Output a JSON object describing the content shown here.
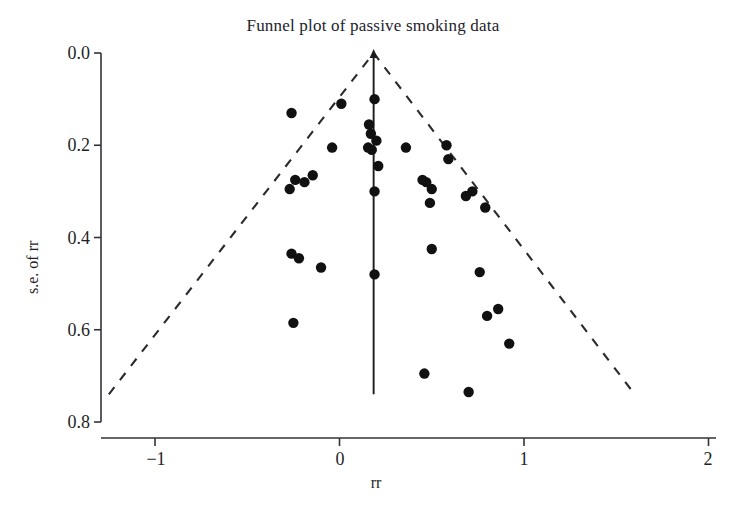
{
  "chart_data": {
    "type": "scatter",
    "title": "Funnel plot of passive smoking data",
    "xlabel": "rr",
    "ylabel": "s.e. of rr",
    "xlim": [
      -1.29,
      2.07
    ],
    "ylim": [
      0.86,
      -0.02
    ],
    "y_inverted": true,
    "grid": false,
    "legend": "none",
    "xticks": [
      -1,
      0,
      1,
      2
    ],
    "xtick_labels": [
      "−1",
      "0",
      "1",
      "2"
    ],
    "yticks": [
      0.0,
      0.2,
      0.4,
      0.6,
      0.8
    ],
    "ytick_labels": [
      "0.0",
      "0.2",
      "0.4",
      "0.6",
      "0.8"
    ],
    "series": [
      {
        "name": "studies",
        "marker": "filled-circle",
        "color": "#111111",
        "points": [
          {
            "x": 0.19,
            "y": 0.1
          },
          {
            "x": -0.26,
            "y": 0.13
          },
          {
            "x": 0.01,
            "y": 0.11
          },
          {
            "x": 0.16,
            "y": 0.155
          },
          {
            "x": 0.17,
            "y": 0.175
          },
          {
            "x": 0.2,
            "y": 0.19
          },
          {
            "x": 0.155,
            "y": 0.205
          },
          {
            "x": 0.175,
            "y": 0.21
          },
          {
            "x": -0.04,
            "y": 0.205
          },
          {
            "x": 0.36,
            "y": 0.205
          },
          {
            "x": 0.58,
            "y": 0.2
          },
          {
            "x": 0.59,
            "y": 0.23
          },
          {
            "x": 0.21,
            "y": 0.245
          },
          {
            "x": -0.24,
            "y": 0.275
          },
          {
            "x": -0.19,
            "y": 0.28
          },
          {
            "x": -0.145,
            "y": 0.265
          },
          {
            "x": 0.45,
            "y": 0.275
          },
          {
            "x": 0.47,
            "y": 0.28
          },
          {
            "x": 0.5,
            "y": 0.295
          },
          {
            "x": 0.72,
            "y": 0.3
          },
          {
            "x": -0.27,
            "y": 0.295
          },
          {
            "x": 0.19,
            "y": 0.3
          },
          {
            "x": 0.685,
            "y": 0.31
          },
          {
            "x": 0.49,
            "y": 0.325
          },
          {
            "x": 0.79,
            "y": 0.335
          },
          {
            "x": -0.26,
            "y": 0.435
          },
          {
            "x": -0.22,
            "y": 0.445
          },
          {
            "x": 0.5,
            "y": 0.425
          },
          {
            "x": -0.1,
            "y": 0.465
          },
          {
            "x": 0.19,
            "y": 0.48
          },
          {
            "x": 0.76,
            "y": 0.475
          },
          {
            "x": -0.25,
            "y": 0.585
          },
          {
            "x": 0.86,
            "y": 0.555
          },
          {
            "x": 0.8,
            "y": 0.57
          },
          {
            "x": 0.92,
            "y": 0.63
          },
          {
            "x": 0.46,
            "y": 0.695
          },
          {
            "x": 0.7,
            "y": 0.735
          }
        ]
      }
    ],
    "reference_line": {
      "type": "vertical-solid",
      "x": 0.185,
      "from_y": 0.0,
      "to_y": 0.74
    },
    "funnel_bounds": {
      "type": "dashed-triangle",
      "apex": {
        "x": 0.185,
        "y": 0.0
      },
      "left_end": {
        "x": -1.25,
        "y": 0.74
      },
      "right_end": {
        "x": 1.6,
        "y": 0.74
      }
    }
  }
}
